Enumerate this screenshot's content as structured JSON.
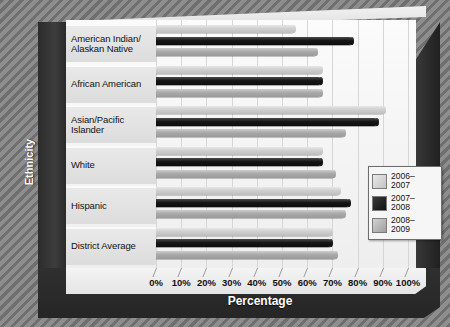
{
  "chart_data": {
    "type": "bar",
    "orientation": "horizontal",
    "title": "",
    "xlabel": "Percentage",
    "ylabel": "Ethnicity",
    "xlim": [
      0,
      100
    ],
    "xticks": [
      "0%",
      "10%",
      "20%",
      "30%",
      "40%",
      "50%",
      "60%",
      "70%",
      "80%",
      "90%",
      "100%"
    ],
    "grid": true,
    "legend_position": "right-bottom-inside",
    "categories": [
      "American Indian/\nAlaskan Native",
      "African American",
      "Asian/Pacific\nIslander",
      "White",
      "Hispanic",
      "District Average"
    ],
    "series": [
      {
        "name": "2006–2007",
        "color": "#cfcfcf",
        "values": [
          55,
          66,
          91,
          66,
          73,
          70
        ]
      },
      {
        "name": "2007–2008",
        "color": "#141414",
        "values": [
          78,
          66,
          88,
          66,
          77,
          70
        ]
      },
      {
        "name": "2008–2009",
        "color": "#a9a9a9",
        "values": [
          64,
          66,
          75,
          71,
          75,
          72
        ]
      }
    ]
  },
  "axis": {
    "x_title": "Percentage",
    "y_title": "Ethnicity"
  },
  "categories": [
    {
      "line1": "American Indian/",
      "line2": "Alaskan Native"
    },
    {
      "line1": "African American",
      "line2": ""
    },
    {
      "line1": "Asian/Pacific",
      "line2": "Islander"
    },
    {
      "line1": "White",
      "line2": ""
    },
    {
      "line1": "Hispanic",
      "line2": ""
    },
    {
      "line1": "District Average",
      "line2": ""
    }
  ],
  "legend": {
    "items": [
      {
        "label1": "2006–",
        "label2": "2007"
      },
      {
        "label1": "2007–",
        "label2": "2008"
      },
      {
        "label1": "2008–",
        "label2": "2009"
      }
    ]
  },
  "ticks": [
    "0%",
    "10%",
    "20%",
    "30%",
    "40%",
    "50%",
    "60%",
    "70%",
    "80%",
    "90%",
    "100%"
  ]
}
